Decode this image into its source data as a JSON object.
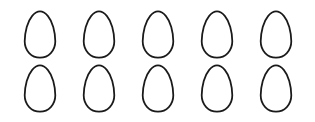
{
  "scene": {
    "title": "Egg outline grid",
    "background_color": "#ffffff",
    "stroke_color": "#1a1a1a",
    "fill_color": "#ffffff",
    "columns": 5,
    "rows": 2,
    "total_count": 10
  },
  "eggs": [
    {
      "id": "egg-1",
      "row": 1,
      "column": 1,
      "label": "egg"
    },
    {
      "id": "egg-2",
      "row": 1,
      "column": 2,
      "label": "egg"
    },
    {
      "id": "egg-3",
      "row": 1,
      "column": 3,
      "label": "egg"
    },
    {
      "id": "egg-4",
      "row": 1,
      "column": 4,
      "label": "egg"
    },
    {
      "id": "egg-5",
      "row": 1,
      "column": 5,
      "label": "egg"
    },
    {
      "id": "egg-6",
      "row": 2,
      "column": 1,
      "label": "egg"
    },
    {
      "id": "egg-7",
      "row": 2,
      "column": 2,
      "label": "egg"
    },
    {
      "id": "egg-8",
      "row": 2,
      "column": 3,
      "label": "egg"
    },
    {
      "id": "egg-9",
      "row": 2,
      "column": 4,
      "label": "egg"
    },
    {
      "id": "egg-10",
      "row": 2,
      "column": 5,
      "label": "egg"
    }
  ]
}
